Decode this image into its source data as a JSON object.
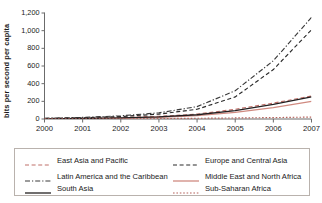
{
  "chart_data": {
    "type": "line",
    "title": "",
    "xlabel": "",
    "ylabel": "bits per second per capita",
    "x": [
      2000,
      2001,
      2002,
      2003,
      2004,
      2005,
      2006,
      2007
    ],
    "xticklabels": [
      "2000",
      "2001",
      "2002",
      "2003",
      "2004",
      "2005",
      "2006",
      "2007"
    ],
    "yticklabels": [
      "0",
      "200",
      "400",
      "600",
      "800",
      "1,000",
      "1,200"
    ],
    "yticks": [
      0,
      200,
      400,
      600,
      800,
      1000,
      1200
    ],
    "ylim": [
      0,
      1200
    ],
    "xlim": [
      2000,
      2007
    ],
    "grid": false,
    "legend_position": "bottom",
    "series": [
      {
        "name": "East Asia and Pacific",
        "style": "dashed",
        "color": "#c0706a",
        "values": [
          4,
          9,
          17,
          30,
          55,
          110,
          180,
          260
        ]
      },
      {
        "name": "Europe and Central Asia",
        "style": "dashed",
        "color": "#2b2b2b",
        "values": [
          6,
          14,
          28,
          55,
          110,
          250,
          560,
          1010
        ]
      },
      {
        "name": "Latin America and the Caribbean",
        "style": "dashdot",
        "color": "#3a3a3a",
        "values": [
          8,
          18,
          36,
          70,
          140,
          320,
          660,
          1150
        ]
      },
      {
        "name": "Middle East and North Africa",
        "style": "solid",
        "color": "#d08a80",
        "values": [
          2,
          5,
          10,
          20,
          38,
          75,
          130,
          200
        ]
      },
      {
        "name": "South Asia",
        "style": "solid",
        "color": "#231f20",
        "values": [
          2,
          6,
          12,
          24,
          48,
          95,
          165,
          250
        ]
      },
      {
        "name": "Sub-Saharan Africa",
        "style": "dotted",
        "color": "#b5635c",
        "values": [
          1,
          2,
          3,
          5,
          8,
          12,
          16,
          22
        ]
      }
    ]
  },
  "legend": {
    "items": [
      {
        "label": "East Asia and Pacific"
      },
      {
        "label": "Europe and Central Asia"
      },
      {
        "label": "Latin America and the Caribbean"
      },
      {
        "label": "Middle East and North Africa"
      },
      {
        "label": "South Asia"
      },
      {
        "label": "Sub-Saharan Africa"
      }
    ]
  },
  "colors": {
    "axis": "#6b6b6b",
    "text": "#1a1a1a",
    "legend_border": "#b9b2ad",
    "background": "#ffffff"
  }
}
